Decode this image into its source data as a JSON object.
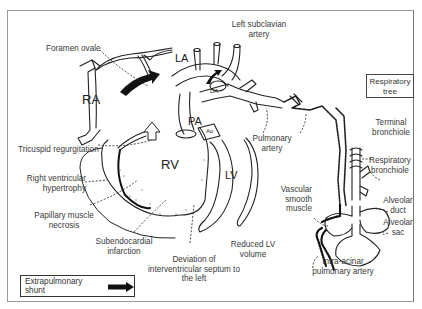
{
  "diagram": {
    "chambers": {
      "ra": "RA",
      "la": "LA",
      "rv": "RV",
      "lv": "LV",
      "pa": "PA",
      "ao": "Ao",
      "da": "DA"
    },
    "labels": {
      "foramen_ovale": "Foramen ovale",
      "left_subclavian_line1": "Left subclavian",
      "left_subclavian_line2": "artery",
      "tricuspid_regurgitation": "Tricuspid regurgitation",
      "rv_hypertrophy_line1": "Right ventricular",
      "rv_hypertrophy_line2": "hypertrophy",
      "papillary_line1": "Papillary muscle",
      "papillary_line2": "necrosis",
      "subendo_line1": "Subendocardial",
      "subendo_line2": "infarction",
      "deviation_line1": "Deviation of",
      "deviation_line2": "interventricular septum to",
      "deviation_line3": "the left",
      "reduced_lv_line1": "Reduced LV",
      "reduced_lv_line2": "volume",
      "pulmonary_artery_line1": "Pulmonary",
      "pulmonary_artery_line2": "artery",
      "terminal_bronchiole_line1": "Terminal",
      "terminal_bronchiole_line2": "bronchiole",
      "respiratory_bronchiole_line1": "Respiratory",
      "respiratory_bronchiole_line2": "bronchiole",
      "vascular_smooth_line1": "Vascular",
      "vascular_smooth_line2": "smooth",
      "vascular_smooth_line3": "muscle",
      "alveolar_duct_line1": "Alveolar",
      "alveolar_duct_line2": "duct",
      "alveolar_sac_line1": "Alveolar",
      "alveolar_sac_line2": "sac",
      "intra_acinar_line1": "Intra-acinar",
      "intra_acinar_line2": "pulmonary artery"
    },
    "respiratory_tree_box": {
      "line1": "Respiratory",
      "line2": "tree"
    },
    "legend": {
      "shunt_label": "Extrapulmonary shunt"
    }
  }
}
